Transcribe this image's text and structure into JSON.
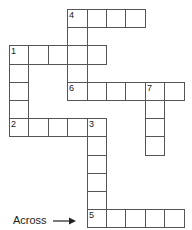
{
  "puzzle": {
    "type": "crossword",
    "cell_w": 19.4,
    "cell_h": 18.2,
    "origin_x": 9,
    "origin_y": 9,
    "words": [
      {
        "number": "4",
        "direction": "across",
        "row": 0,
        "col": 3,
        "length": 4
      },
      {
        "number": "4",
        "direction": "down",
        "row": 0,
        "col": 3,
        "length": 5
      },
      {
        "number": "1",
        "direction": "across",
        "row": 2,
        "col": 0,
        "length": 5
      },
      {
        "number": "1",
        "direction": "down",
        "row": 2,
        "col": 0,
        "length": 5
      },
      {
        "number": "6",
        "direction": "across",
        "row": 4,
        "col": 3,
        "length": 6
      },
      {
        "number": "7",
        "direction": "down",
        "row": 4,
        "col": 7,
        "length": 4
      },
      {
        "number": "2",
        "direction": "across",
        "row": 6,
        "col": 0,
        "length": 5
      },
      {
        "number": "3",
        "direction": "down",
        "row": 6,
        "col": 4,
        "length": 6
      },
      {
        "number": "5",
        "direction": "across",
        "row": 11,
        "col": 4,
        "length": 5
      }
    ]
  },
  "legend": {
    "label": "Across",
    "arrow": "right-arrow-icon"
  },
  "colors": {
    "border": "#555555",
    "text": "#222222",
    "background": "#ffffff"
  }
}
